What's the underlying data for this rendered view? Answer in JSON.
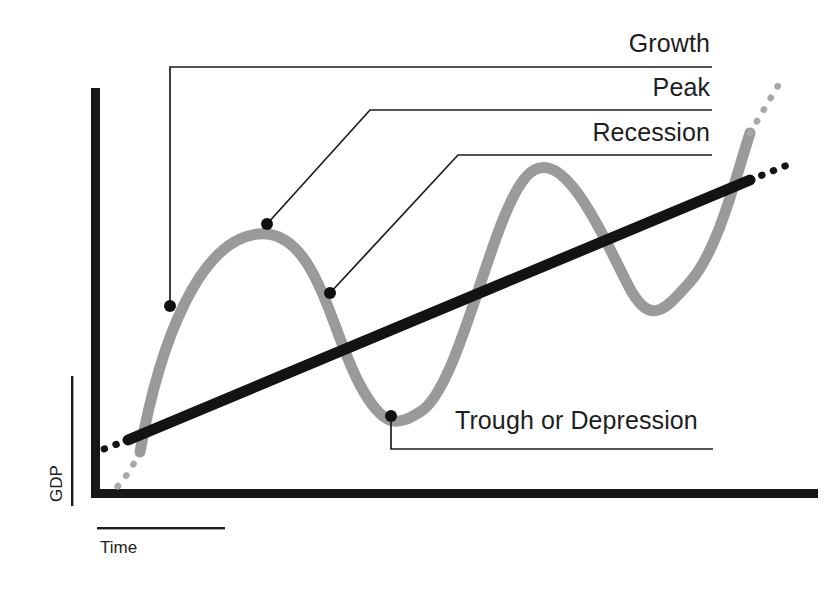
{
  "figure": {
    "kind": "business-cycle-diagram",
    "background_color": "#ffffff"
  },
  "axes": {
    "y_axis_label": "GDP",
    "x_axis_label": "Time",
    "y_axis_color": "#171717",
    "x_axis_color": "#171717"
  },
  "callouts": [
    {
      "id": "growth",
      "label": "Growth",
      "target": "rising phase of the cycle",
      "dot": {
        "x": 170,
        "y": 306
      },
      "elbow": {
        "x": 170,
        "y": 67
      },
      "rule_end": {
        "x": 712,
        "y": 67
      },
      "text_anchor": {
        "x": 710,
        "y": 52
      }
    },
    {
      "id": "peak",
      "label": "Peak",
      "target": "first cycle peak",
      "dot": {
        "x": 267,
        "y": 224
      },
      "elbow": {
        "x": 370,
        "y": 110
      },
      "rule_end": {
        "x": 712,
        "y": 110
      },
      "text_anchor": {
        "x": 710,
        "y": 96
      }
    },
    {
      "id": "recession",
      "label": "Recession",
      "target": "falling phase after first peak",
      "dot": {
        "x": 330,
        "y": 293
      },
      "elbow": {
        "x": 458,
        "y": 155
      },
      "rule_end": {
        "x": 712,
        "y": 155
      },
      "text_anchor": {
        "x": 710,
        "y": 141
      }
    },
    {
      "id": "trough",
      "label": "Trough or Depression",
      "target": "first cycle trough",
      "dot": {
        "x": 391,
        "y": 416
      },
      "elbow": {
        "x": 391,
        "y": 449
      },
      "rule_end": {
        "x": 713,
        "y": 449
      },
      "text_anchor": {
        "x": 455,
        "y": 429
      }
    }
  ],
  "chart_data": {
    "type": "line",
    "title": "",
    "xlabel": "Time",
    "ylabel": "GDP",
    "grid": false,
    "legend": null,
    "axis_origin": {
      "x": 95,
      "y": 496
    },
    "x_axis_extent": [
      95,
      822
    ],
    "y_axis_extent": [
      88,
      496
    ],
    "series": [
      {
        "name": "Business cycle (actual GDP)",
        "style": "solid-thick",
        "color": "#9a9a9a",
        "path": "M 140 452 C 160 340, 200 240, 258 234 C 316 228, 330 330, 360 385 C 385 432, 400 424, 420 412 C 460 388, 490 220, 525 178 C 560 136, 600 230, 628 285 C 650 328, 665 310, 690 282 C 718 250, 735 180, 750 133",
        "key_points": [
          {
            "role": "start",
            "x": 140,
            "y": 452
          },
          {
            "role": "peak",
            "x": 258,
            "y": 234,
            "label": "Peak"
          },
          {
            "role": "trough",
            "x": 392,
            "y": 417,
            "label": "Trough or Depression"
          },
          {
            "role": "peak",
            "x": 525,
            "y": 178
          },
          {
            "role": "trough",
            "x": 640,
            "y": 295
          },
          {
            "role": "end",
            "x": 750,
            "y": 133
          }
        ],
        "dotted_extension_before": "M 140 452 C 131 470, 122 483, 112 492",
        "dotted_extension_after": "M 750 133 L 779 84"
      },
      {
        "name": "Long-run growth trend",
        "style": "solid-thick",
        "color": "#131313",
        "path": "M 128 440 L 750 180",
        "key_points": [
          {
            "role": "start",
            "x": 128,
            "y": 440
          },
          {
            "role": "end",
            "x": 750,
            "y": 180
          }
        ],
        "dotted_extension_before": "M 128 440 L 96 452",
        "dotted_extension_after": "M 750 180 L 790 164"
      }
    ],
    "annotations": [
      {
        "text": "Growth",
        "at": {
          "x": 710,
          "y": 52
        }
      },
      {
        "text": "Peak",
        "at": {
          "x": 710,
          "y": 96
        }
      },
      {
        "text": "Recession",
        "at": {
          "x": 710,
          "y": 141
        }
      },
      {
        "text": "Trough or Depression",
        "at": {
          "x": 455,
          "y": 429
        }
      }
    ]
  },
  "colors": {
    "cycle_curve": "#9a9a9a",
    "trend_line": "#131313",
    "axis": "#171717",
    "text": "#1d1d1d"
  }
}
